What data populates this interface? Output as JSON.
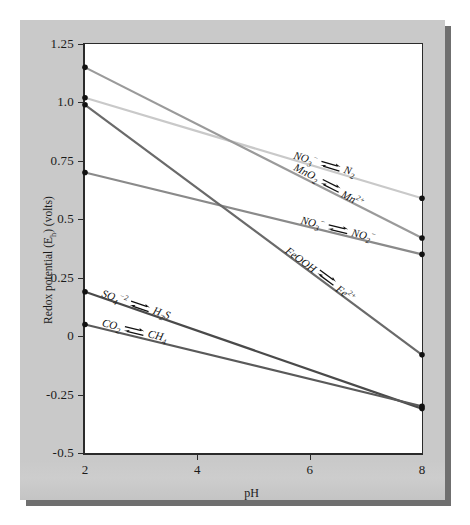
{
  "figure": {
    "background": "#c9c9c9",
    "plot_background": "#ffffff"
  },
  "axes": {
    "x_title": "pH",
    "y_title_parts": {
      "main": "Redox potential (E",
      "sub": "h",
      "tail": ") (volts)"
    },
    "y_title_plain": "Redox potential (Eh) (volts)",
    "x_ticks": [
      "2",
      "4",
      "6",
      "8"
    ],
    "y_ticks": [
      "1.25",
      "1.0",
      "0.75",
      "0.5",
      "0.25",
      "0",
      "-0.25",
      "-0.5"
    ]
  },
  "chart_data": {
    "type": "line",
    "title": "",
    "xlabel": "pH",
    "ylabel": "Redox potential (Eh) (volts)",
    "xlim": [
      2,
      8
    ],
    "ylim": [
      -0.5,
      1.25
    ],
    "x_ticks": [
      2,
      4,
      6,
      8
    ],
    "y_ticks": [
      1.25,
      1.0,
      0.75,
      0.5,
      0.25,
      0,
      -0.25,
      -0.5
    ],
    "grid": false,
    "legend": "inline-annotations",
    "x": [
      2,
      8
    ],
    "series": [
      {
        "name": "NO3- / N2",
        "left_label": "NO3-",
        "right_label": "N2",
        "values": [
          1.02,
          0.59
        ],
        "color": "#c9c9c9"
      },
      {
        "name": "MnO2 / Mn2+",
        "left_label": "MnO2",
        "right_label": "Mn2+",
        "values": [
          1.15,
          0.42
        ],
        "color": "#9a9a9a"
      },
      {
        "name": "NO3- / NO2-",
        "left_label": "NO3-",
        "right_label": "NO2-",
        "values": [
          0.7,
          0.35
        ],
        "color": "#8a8a8a"
      },
      {
        "name": "FeOOH / Fe2+",
        "left_label": "FeOOH",
        "right_label": "Fe2+",
        "values": [
          0.99,
          -0.08
        ],
        "color": "#6a6a6a"
      },
      {
        "name": "SO4-2 / H2S",
        "left_label": "SO4-2",
        "right_label": "H2S",
        "values": [
          0.19,
          -0.31
        ],
        "color": "#4a4a4a"
      },
      {
        "name": "CO2 / CH4",
        "left_label": "CO2",
        "right_label": "CH4",
        "values": [
          0.05,
          -0.3
        ],
        "color": "#5a5a5a"
      }
    ]
  },
  "annotations": [
    {
      "id": "no3-n2",
      "left": "NO3−",
      "left_html": "NO<sub>3</sub><sup>−</sup>",
      "right": "N2",
      "right_html": "N<sub>2</sub>"
    },
    {
      "id": "mno2-mn2",
      "left": "MnO2",
      "left_html": "MnO<sub>2</sub>",
      "right": "Mn2+",
      "right_html": "Mn<sup>2+</sup>"
    },
    {
      "id": "no3-no2",
      "left": "NO3−",
      "left_html": "NO<sub>3</sub><sup>−</sup>",
      "right": "NO2−",
      "right_html": "NO<sub>2</sub><sup>−</sup>"
    },
    {
      "id": "feooh-fe2",
      "left": "FeOOH",
      "left_html": "FeOOH",
      "right": "Fe2+",
      "right_html": "Fe<sup>2+</sup>"
    },
    {
      "id": "so4-h2s",
      "left": "SO4-2",
      "left_html": "SO<sub>4</sub><sup>−2</sup>",
      "right": "H2S",
      "right_html": "H<sub>2</sub>S"
    },
    {
      "id": "co2-ch4",
      "left": "CO2",
      "left_html": "CO<sub>2</sub>",
      "right": "CH4",
      "right_html": "CH<sub>4</sub>"
    }
  ]
}
